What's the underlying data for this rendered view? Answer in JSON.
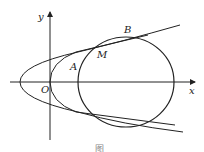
{
  "figure": {
    "labels": {
      "y_axis": "y",
      "x_axis": "x",
      "origin": "O",
      "point_a": "A",
      "point_b": "B",
      "point_m": "M"
    },
    "caption": "图"
  }
}
